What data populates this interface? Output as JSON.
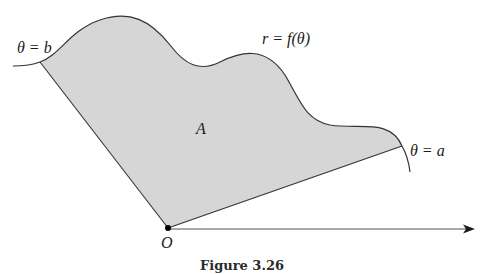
{
  "figure": {
    "caption": "Figure 3.26",
    "labels": {
      "theta_b": "θ = b",
      "theta_a": "θ = a",
      "curve": "r = f(θ)",
      "region": "A",
      "origin": "O"
    },
    "colors": {
      "region_fill": "#d6d6d6",
      "stroke": "#333333",
      "background": "#ffffff"
    }
  }
}
